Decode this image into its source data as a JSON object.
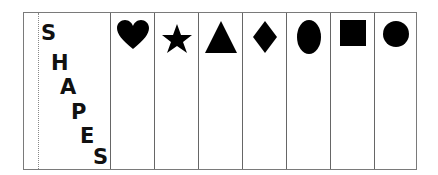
{
  "title": {
    "letters": [
      "S",
      "H",
      "A",
      "P",
      "E",
      "S"
    ]
  },
  "shapes": [
    {
      "name": "heart"
    },
    {
      "name": "star"
    },
    {
      "name": "triangle"
    },
    {
      "name": "diamond"
    },
    {
      "name": "oval"
    },
    {
      "name": "square"
    },
    {
      "name": "circle"
    }
  ],
  "colors": {
    "shape_fill": "#000000",
    "border": "#7a7a7a"
  }
}
